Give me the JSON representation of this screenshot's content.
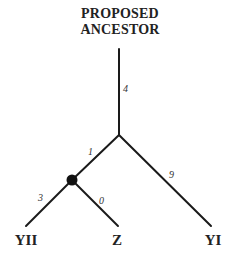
{
  "diagram": {
    "type": "phylogenetic-tree",
    "root": {
      "label_line1": "PROPOSED",
      "label_line2": "ANCESTOR"
    },
    "leaves": [
      {
        "id": "YII",
        "label": "YII"
      },
      {
        "id": "Z",
        "label": "Z"
      },
      {
        "id": "YI",
        "label": "YI"
      }
    ],
    "branches": [
      {
        "from": "ancestor",
        "to": "junction",
        "label": "4"
      },
      {
        "from": "junction",
        "to": "node",
        "label": "1"
      },
      {
        "from": "junction",
        "to": "YI",
        "label": "9"
      },
      {
        "from": "node",
        "to": "YII",
        "label": "3"
      },
      {
        "from": "node",
        "to": "Z",
        "label": "0"
      }
    ],
    "colors": {
      "line": "#1a1a1a",
      "text": "#222222",
      "node": "#111111"
    }
  }
}
